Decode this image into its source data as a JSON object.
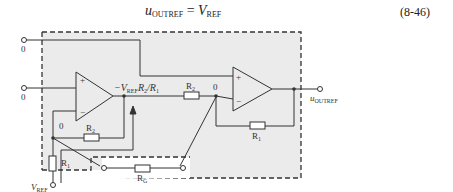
{
  "equation": {
    "lhs_var": "u",
    "lhs_sub": "OUTREF",
    "equals": "=",
    "rhs_var": "V",
    "rhs_sub": "REF",
    "number": "(8-46)"
  },
  "diagram": {
    "colors": {
      "box_fill": "#ebebeb",
      "line": "#333333",
      "background": "#ffffff"
    },
    "labels": {
      "in1_value": "0",
      "in2_value": "0",
      "opamp_plus": "+",
      "opamp_minus": "−",
      "node_minus1": "0",
      "node_minus2": "0",
      "mid_voltage_prefix": "−V",
      "mid_voltage_sub": "REF",
      "mid_voltage_suffix": "R",
      "mid_voltage_r2_sub": "2",
      "mid_voltage_div": "/R",
      "mid_voltage_r1_sub": "1",
      "r2_a": "R",
      "r2_a_sub": "2",
      "r2_b": "R",
      "r2_b_sub": "2",
      "r1_a": "R",
      "r1_a_sub": "1",
      "r1_b": "R",
      "r1_b_sub": "1",
      "rg": "R",
      "rg_sub": "G",
      "vref": "V",
      "vref_sub": "REF",
      "out": "u",
      "out_sub": "OUTREF"
    }
  }
}
